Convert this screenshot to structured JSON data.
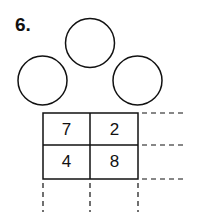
{
  "problem": {
    "number_label": "6."
  },
  "circles": [
    {
      "position": "top",
      "value": ""
    },
    {
      "position": "left",
      "value": ""
    },
    {
      "position": "right",
      "value": ""
    }
  ],
  "grid": {
    "rows": [
      [
        "7",
        "2"
      ],
      [
        "4",
        "8"
      ]
    ]
  },
  "colors": {
    "stroke": "#111111",
    "background": "#ffffff"
  }
}
